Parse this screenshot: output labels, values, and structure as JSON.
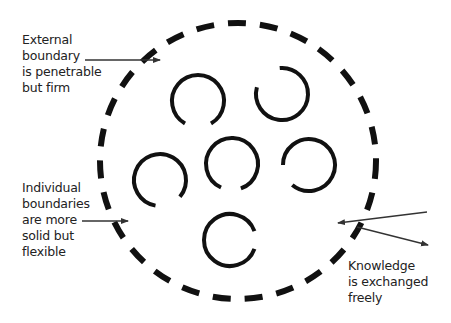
{
  "labels": {
    "external": "External\nboundary\nis penetrable\nbut firm",
    "individual": "Individual\nboundaries\nare more\nsolid but\nflexible",
    "knowledge": "Knowledge\nis exchanged\nfreely"
  },
  "colors": {
    "stroke": "#111111",
    "arrow": "#333333",
    "text": "#222222",
    "background": "#ffffff"
  },
  "outer_boundary": {
    "cx": 238,
    "cy": 161,
    "r": 138,
    "stroke_width": 6,
    "dash": "18 14"
  },
  "individuals": [
    {
      "cx": 198,
      "cy": 101,
      "r": 26,
      "gap_start": 60,
      "gap_end": 120
    },
    {
      "cx": 282,
      "cy": 94,
      "r": 26,
      "gap_start": 195,
      "gap_end": 265
    },
    {
      "cx": 160,
      "cy": 180,
      "r": 26,
      "gap_start": 40,
      "gap_end": 100
    },
    {
      "cx": 232,
      "cy": 164,
      "r": 26,
      "gap_start": 70,
      "gap_end": 115
    },
    {
      "cx": 309,
      "cy": 165,
      "r": 26,
      "gap_start": 130,
      "gap_end": 180
    },
    {
      "cx": 230,
      "cy": 240,
      "r": 26,
      "gap_start": -20,
      "gap_end": 20
    }
  ],
  "arrows": [
    {
      "name": "external-arrow",
      "x1": 85,
      "y1": 60,
      "x2": 160,
      "y2": 60
    },
    {
      "name": "individual-arrow",
      "x1": 82,
      "y1": 221,
      "x2": 128,
      "y2": 221
    },
    {
      "name": "knowledge-in-arrow",
      "x1": 427,
      "y1": 212,
      "x2": 338,
      "y2": 223
    },
    {
      "name": "knowledge-out-arrow",
      "x1": 357,
      "y1": 227,
      "x2": 428,
      "y2": 245
    }
  ]
}
